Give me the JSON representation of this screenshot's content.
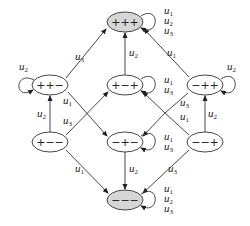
{
  "diagram": {
    "type": "state-transition-graph",
    "nodes": [
      {
        "id": "ppp",
        "label": "+++",
        "x": 125,
        "y": 22,
        "fill": "#d9d9d9",
        "self_loop": {
          "side": "right",
          "labels": [
            "u1",
            "u2",
            "u3"
          ]
        }
      },
      {
        "id": "ppm",
        "label": "++−",
        "x": 50,
        "y": 85,
        "fill": "#ffffff",
        "self_loop": {
          "side": "left",
          "labels": [
            "u2"
          ]
        }
      },
      {
        "id": "pmp",
        "label": "+−+",
        "x": 125,
        "y": 85,
        "fill": "#ffffff",
        "self_loop": {
          "side": "right",
          "labels": [
            "u1",
            "u3"
          ]
        }
      },
      {
        "id": "mpp",
        "label": "−++",
        "x": 205,
        "y": 85,
        "fill": "#ffffff",
        "self_loop": {
          "side": "right",
          "labels": [
            "u2"
          ]
        }
      },
      {
        "id": "pmm",
        "label": "+−−",
        "x": 50,
        "y": 142,
        "fill": "#ffffff",
        "self_loop": null
      },
      {
        "id": "mpm",
        "label": "−+−",
        "x": 125,
        "y": 142,
        "fill": "#ffffff",
        "self_loop": {
          "side": "right",
          "labels": [
            "u1",
            "u3"
          ]
        }
      },
      {
        "id": "mmp",
        "label": "−−+",
        "x": 205,
        "y": 142,
        "fill": "#ffffff",
        "self_loop": null
      },
      {
        "id": "mmm",
        "label": "−−−",
        "x": 125,
        "y": 200,
        "fill": "#d9d9d9",
        "self_loop": {
          "side": "right",
          "labels": [
            "u1",
            "u2",
            "u3"
          ]
        }
      }
    ],
    "edges": [
      {
        "from": "ppm",
        "to": "ppp",
        "label": "u3"
      },
      {
        "from": "ppm",
        "to": "mpm",
        "label": "u1"
      },
      {
        "from": "pmm",
        "to": "ppm",
        "label": "u2"
      },
      {
        "from": "pmm",
        "to": "pmp",
        "label": "u3"
      },
      {
        "from": "pmm",
        "to": "mmm",
        "label": "u1"
      },
      {
        "from": "pmp",
        "to": "ppp",
        "label": "u2"
      },
      {
        "from": "mpp",
        "to": "ppp",
        "label": "u1"
      },
      {
        "from": "mpp",
        "to": "pmp",
        "label": "u3"
      },
      {
        "from": "mmp",
        "to": "mpp",
        "label": "u2"
      },
      {
        "from": "mmp",
        "to": "mpm",
        "label": "u1"
      },
      {
        "from": "mmp",
        "to": "mmm",
        "label": "u3"
      },
      {
        "from": "mpm",
        "to": "mmm",
        "label": "u2"
      }
    ]
  },
  "labels": {
    "ppp": "+++",
    "ppm": "++−",
    "pmp": "+−+",
    "mpp": "−++",
    "pmm": "+−−",
    "mpm": "−+−",
    "mmp": "−−+",
    "mmm": "−−−"
  }
}
